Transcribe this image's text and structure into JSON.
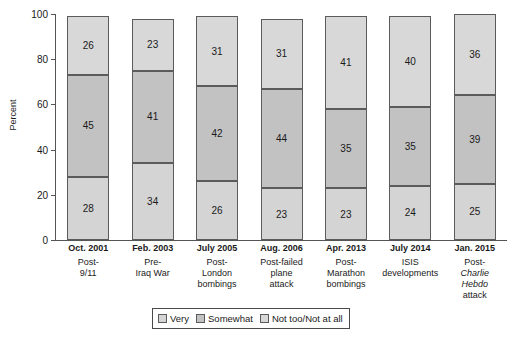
{
  "chart_data": {
    "type": "bar",
    "subtype": "stacked-100-percent",
    "title": "",
    "top_bleed_text": "",
    "xlabel": "",
    "ylabel": "Percent",
    "ylim": [
      0,
      100
    ],
    "yticks": [
      0,
      20,
      40,
      60,
      80,
      100
    ],
    "grid": false,
    "legend_position": "bottom-center",
    "categories": [
      "Oct. 2001",
      "Feb. 2003",
      "July 2005",
      "Aug. 2006",
      "Apr. 2013",
      "July 2014",
      "Jan. 2015"
    ],
    "category_sublabels": [
      "Post-\n9/11",
      "Pre-\nIraq War",
      "Post-\nLondon\nbombings",
      "Post-failed\nplane\nattack",
      "Post-\nMarathon\nbombings",
      "ISIS\ndevelopments",
      "Post-\nCharlie Hebdo\nattack"
    ],
    "series": [
      {
        "name": "Very",
        "values": [
          28,
          34,
          26,
          23,
          23,
          24,
          25
        ],
        "color": "#d4d4d4"
      },
      {
        "name": "Somewhat",
        "values": [
          45,
          41,
          42,
          44,
          35,
          35,
          39
        ],
        "color": "#c2c2c2"
      },
      {
        "name": "Not too/Not at all",
        "values": [
          26,
          23,
          31,
          31,
          41,
          40,
          36
        ],
        "color": "#d8d8d8"
      }
    ]
  },
  "axis": {
    "y_title": "Percent",
    "y_ticks": [
      "100",
      "80",
      "60",
      "40",
      "20",
      "0"
    ]
  },
  "bars": [
    {
      "date": "Oct. 2001",
      "desc_lines": [
        "Post-",
        "9/11"
      ],
      "italic_line_index": -1,
      "very": 28,
      "somewhat": 45,
      "nottoo": 26
    },
    {
      "date": "Feb. 2003",
      "desc_lines": [
        "Pre-",
        "Iraq War"
      ],
      "italic_line_index": -1,
      "very": 34,
      "somewhat": 41,
      "nottoo": 23
    },
    {
      "date": "July 2005",
      "desc_lines": [
        "Post-",
        "London",
        "bombings"
      ],
      "italic_line_index": -1,
      "very": 26,
      "somewhat": 42,
      "nottoo": 31
    },
    {
      "date": "Aug. 2006",
      "desc_lines": [
        "Post-failed",
        "plane",
        "attack"
      ],
      "italic_line_index": -1,
      "very": 23,
      "somewhat": 44,
      "nottoo": 31
    },
    {
      "date": "Apr. 2013",
      "desc_lines": [
        "Post-",
        "Marathon",
        "bombings"
      ],
      "italic_line_index": -1,
      "very": 23,
      "somewhat": 35,
      "nottoo": 41
    },
    {
      "date": "July 2014",
      "desc_lines": [
        "ISIS",
        "developments"
      ],
      "italic_line_index": -1,
      "very": 24,
      "somewhat": 35,
      "nottoo": 40
    },
    {
      "date": "Jan. 2015",
      "desc_lines": [
        "Post-",
        "Charlie",
        "Hebdo",
        "attack"
      ],
      "italic_line_index": 1,
      "italic_line_index2": 2,
      "very": 25,
      "somewhat": 39,
      "nottoo": 36
    }
  ],
  "legend": {
    "items": [
      {
        "label": "Very",
        "color": "#d4d4d4"
      },
      {
        "label": "Somewhat",
        "color": "#c2c2c2"
      },
      {
        "label": "Not too/Not at all",
        "color": "#d8d8d8"
      }
    ]
  }
}
